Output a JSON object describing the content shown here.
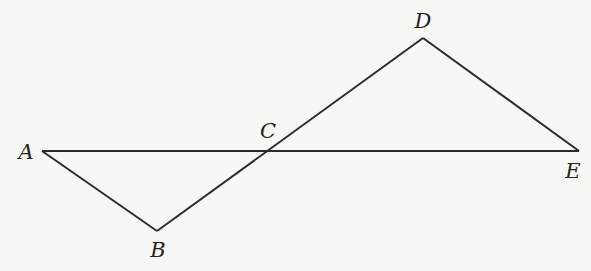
{
  "diagram": {
    "type": "geometry",
    "points": [
      {
        "name": "A",
        "x": 42,
        "y": 151,
        "label_x": 26,
        "label_y": 159
      },
      {
        "name": "B",
        "x": 157,
        "y": 231,
        "label_x": 158,
        "label_y": 257
      },
      {
        "name": "C",
        "x": 268,
        "y": 151,
        "label_x": 268,
        "label_y": 138
      },
      {
        "name": "D",
        "x": 423,
        "y": 38,
        "label_x": 423,
        "label_y": 28
      },
      {
        "name": "E",
        "x": 579,
        "y": 151,
        "label_x": 573,
        "label_y": 178
      }
    ],
    "segments": [
      {
        "from": "A",
        "to": "E"
      },
      {
        "from": "A",
        "to": "B"
      },
      {
        "from": "B",
        "to": "D"
      },
      {
        "from": "D",
        "to": "E"
      }
    ],
    "labels": {
      "A": "A",
      "B": "B",
      "C": "C",
      "D": "D",
      "E": "E"
    },
    "stroke_color": "#2a2a2a"
  }
}
